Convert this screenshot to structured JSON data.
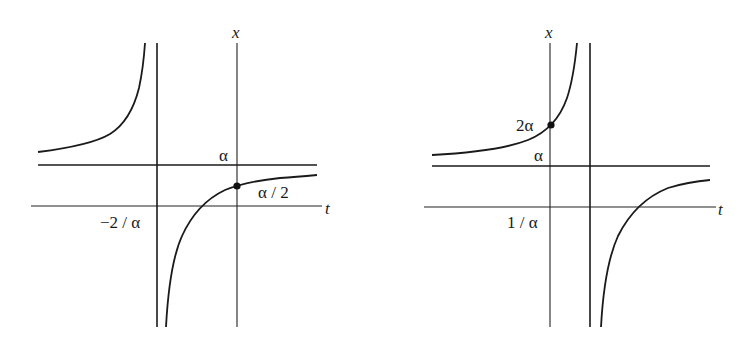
{
  "left_graph": {
    "x_axis_label": "x",
    "t_axis_label": "t",
    "horizontal_asymptote_label": "α",
    "vertical_asymptote_label": "−2 / α",
    "marked_point_label": "α / 2",
    "marked_point": {
      "t": 0,
      "x": "α / 2"
    },
    "vertical_asymptote": "t = −2 / α",
    "horizontal_asymptote": "x = α"
  },
  "right_graph": {
    "x_axis_label": "x",
    "t_axis_label": "t",
    "horizontal_asymptote_label": "α",
    "vertical_asymptote_label": "1 / α",
    "marked_point_label": "2α",
    "marked_point": {
      "t": 0,
      "x": "2α"
    },
    "vertical_asymptote": "t = 1 / α",
    "horizontal_asymptote": "x = α"
  },
  "colors": {
    "ink": "#1a1a1a",
    "background": "#ffffff"
  }
}
